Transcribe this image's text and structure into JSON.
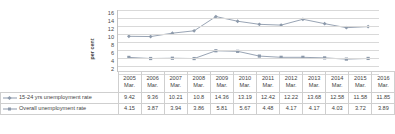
{
  "chart_data": {
    "type": "line",
    "title": "",
    "xlabel": "",
    "ylabel": "per cent",
    "ylim": [
      0,
      16
    ],
    "yticks": [
      16,
      14,
      12,
      10,
      8,
      6,
      4,
      2,
      0
    ],
    "grid": true,
    "legend_position": "table-left",
    "categories": [
      "2005",
      "2006",
      "2007",
      "2008",
      "2009",
      "2010",
      "2011",
      "2012",
      "2013",
      "2014",
      "2015",
      "2016"
    ],
    "category_sublabels": [
      "Mar.",
      "Mar.",
      "Mar.",
      "Mar.",
      "Mar.",
      "Mar.",
      "Mar.",
      "Mar.",
      "Mar.",
      "Mar.",
      "Mar.",
      "Mar."
    ],
    "series": [
      {
        "name": "15-24 yrs unemployment rate",
        "marker": "diamond",
        "color": "#8d9aab",
        "values": [
          9.42,
          9.36,
          10.21,
          10.8,
          14.36,
          13.19,
          12.42,
          12.22,
          13.68,
          12.58,
          11.58,
          11.85
        ],
        "value_labels": [
          "9.42",
          "9.36",
          "10.21",
          "10.8",
          "14.36",
          "13.19",
          "12.42",
          "12.22",
          "13.68",
          "12.58",
          "11.58",
          "11.85"
        ]
      },
      {
        "name": "Overall unemployment rate",
        "marker": "square",
        "color": "#8d9aab",
        "values": [
          4.15,
          3.87,
          3.94,
          3.86,
          5.81,
          5.67,
          4.48,
          4.17,
          4.17,
          4.03,
          3.72,
          3.89
        ],
        "value_labels": [
          "4.15",
          "3.87",
          "3.94",
          "3.86",
          "5.81",
          "5.67",
          "4.48",
          "4.17",
          "4.17",
          "4.03",
          "3.72",
          "3.89"
        ]
      }
    ]
  },
  "colors": {
    "series_line": "#8d9aab",
    "gridline": "#d9d9d9",
    "table_border": "#cfcfcf",
    "text": "#3f3f3f",
    "background": "#ffffff"
  }
}
